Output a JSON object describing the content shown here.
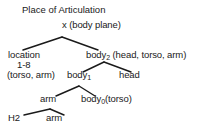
{
  "diagram": {
    "title": "Place of Articulation",
    "type": "tree",
    "nodes": [
      {
        "id": "root",
        "label": "x (body plane)",
        "x": 62,
        "y": 26
      },
      {
        "id": "loc",
        "label": "location",
        "x": 22,
        "y": 52
      },
      {
        "id": "loc2",
        "label": "1-8",
        "x": 31,
        "y": 62
      },
      {
        "id": "body2",
        "label": "body",
        "sub": "2",
        "suffix": " (head, torso, arm)",
        "x": 98,
        "y": 52
      },
      {
        "id": "torsoarm",
        "label": "(torso, arm)",
        "x": 33,
        "y": 74
      },
      {
        "id": "body1",
        "label": "body",
        "sub": "1",
        "x": 81,
        "y": 74
      },
      {
        "id": "head",
        "label": "head",
        "x": 131,
        "y": 74
      },
      {
        "id": "arm1",
        "label": "arm",
        "x": 48,
        "y": 98
      },
      {
        "id": "body0",
        "label": "body",
        "sub": "0",
        "suffix": "(torso)",
        "x": 95,
        "y": 98
      },
      {
        "id": "h2",
        "label": "H2",
        "x": 16,
        "y": 117
      },
      {
        "id": "arm2",
        "label": "arm",
        "x": 54,
        "y": 117
      }
    ],
    "edges": [
      {
        "from": "root",
        "to": "loc",
        "x1": 62,
        "y1": 37,
        "x2": 23,
        "y2": 50
      },
      {
        "from": "root",
        "to": "body2",
        "x1": 62,
        "y1": 37,
        "x2": 98,
        "y2": 50
      },
      {
        "from": "body2",
        "to": "body1",
        "x1": 104,
        "y1": 62,
        "x2": 83,
        "y2": 72
      },
      {
        "from": "body2",
        "to": "head",
        "x1": 104,
        "y1": 62,
        "x2": 131,
        "y2": 72
      },
      {
        "from": "body1",
        "to": "arm1",
        "x1": 79,
        "y1": 86,
        "x2": 56,
        "y2": 96
      },
      {
        "from": "body1",
        "to": "body0",
        "x1": 79,
        "y1": 86,
        "x2": 95,
        "y2": 96
      },
      {
        "from": "arm1",
        "to": "h2",
        "x1": 50,
        "y1": 109,
        "x2": 24,
        "y2": 115
      },
      {
        "from": "arm1",
        "to": "arm2",
        "x1": 50,
        "y1": 109,
        "x2": 64,
        "y2": 115
      }
    ],
    "stroke_color": "#1a1a1a",
    "background_color": "#ffffff"
  }
}
